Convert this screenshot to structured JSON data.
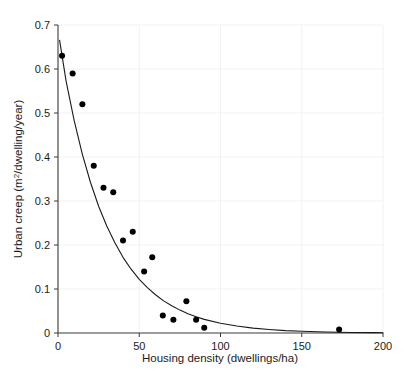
{
  "chart_data": {
    "type": "scatter",
    "title": "",
    "xlabel": "Housing density (dwellings/ha)",
    "ylabel": "Urban creep (m²/dwelling/year)",
    "ylabel_main": "Urban creep (m",
    "ylabel_sup": "2",
    "ylabel_tail": "/dwelling/year)",
    "xlim": [
      0,
      200
    ],
    "ylim": [
      0,
      0.7
    ],
    "xticks": [
      0,
      50,
      100,
      150,
      200
    ],
    "xtick_labels": [
      "0",
      "50",
      "100",
      "150",
      "200"
    ],
    "yticks": [
      0,
      0.1,
      0.2,
      0.3,
      0.4,
      0.5,
      0.6,
      0.7
    ],
    "ytick_labels": [
      "0",
      "0.1",
      "0.2",
      "0.3",
      "0.4",
      "0.5",
      "0.6",
      "0.7"
    ],
    "grid": true,
    "grid_color": "#f2f2f4",
    "legend": null,
    "marker_color": "#000000",
    "marker_size": 5.2,
    "line_color": "#1a1a1a",
    "line_width": 1.1,
    "series": [
      {
        "name": "Observed urban creep",
        "type": "scatter",
        "points": [
          [
            2.5,
            0.63
          ],
          [
            9.0,
            0.59
          ],
          [
            15.0,
            0.52
          ],
          [
            22.0,
            0.38
          ],
          [
            28.0,
            0.33
          ],
          [
            34.0,
            0.32
          ],
          [
            40.0,
            0.21
          ],
          [
            46.0,
            0.23
          ],
          [
            53.0,
            0.14
          ],
          [
            58.0,
            0.172
          ],
          [
            64.5,
            0.04
          ],
          [
            71.0,
            0.03
          ],
          [
            79.0,
            0.072
          ],
          [
            85.0,
            0.03
          ],
          [
            90.0,
            0.012
          ],
          [
            173.0,
            0.008
          ]
        ]
      },
      {
        "name": "Fitted exponential decay curve",
        "type": "line",
        "equation_note": "y = 0.68 * exp(-0.0345 x)",
        "points": [
          [
            1.0,
            0.665
          ],
          [
            5.0,
            0.572
          ],
          [
            10.0,
            0.482
          ],
          [
            15.0,
            0.406
          ],
          [
            20.0,
            0.342
          ],
          [
            25.0,
            0.288
          ],
          [
            30.0,
            0.243
          ],
          [
            35.0,
            0.205
          ],
          [
            40.0,
            0.172
          ],
          [
            45.0,
            0.145
          ],
          [
            50.0,
            0.122
          ],
          [
            55.0,
            0.103
          ],
          [
            60.0,
            0.087
          ],
          [
            65.0,
            0.073
          ],
          [
            70.0,
            0.062
          ],
          [
            75.0,
            0.052
          ],
          [
            80.0,
            0.044
          ],
          [
            85.0,
            0.037
          ],
          [
            90.0,
            0.031
          ],
          [
            100.0,
            0.022
          ],
          [
            110.0,
            0.016
          ],
          [
            120.0,
            0.011
          ],
          [
            130.0,
            0.008
          ],
          [
            140.0,
            0.0055
          ],
          [
            150.0,
            0.004
          ],
          [
            165.0,
            0.0022
          ],
          [
            180.0,
            0.0013
          ],
          [
            195.0,
            0.0008
          ],
          [
            200.0,
            0.0007
          ]
        ]
      }
    ]
  },
  "axes": {
    "x_axis_name": "housing-density-axis",
    "y_axis_name": "urban-creep-axis"
  }
}
